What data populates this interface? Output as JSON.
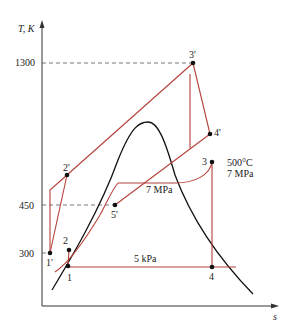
{
  "diagram": {
    "type": "T-s diagram (combined gas-steam cycle)",
    "axes": {
      "y_label": "T, K",
      "x_label": "s",
      "y_ticks": [
        {
          "label": "1300",
          "value": 1300
        },
        {
          "label": "450",
          "value": 450
        },
        {
          "label": "300",
          "value": 300
        }
      ]
    },
    "points": {
      "p1": "1",
      "p2": "2",
      "p3": "3",
      "p4": "4",
      "p1p": "1'",
      "p2p": "2'",
      "p3p": "3'",
      "p4p": "4'",
      "p5p": "5'"
    },
    "annotations": {
      "state3_temp": "500°C",
      "state3_pressure": "7 MPa",
      "high_pressure_line": "7 MPa",
      "low_pressure_line": "5 kPa"
    },
    "colors": {
      "cycle_line": "#b5413a",
      "saturation_dome": "#111111",
      "axis": "#333333",
      "dashed_guides": "#555555"
    }
  }
}
